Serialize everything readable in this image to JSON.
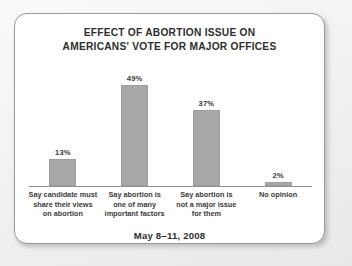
{
  "card": {
    "title_line_1": "EFFECT OF ABORTION ISSUE ON",
    "title_line_2": "AMERICANS' VOTE FOR MAJOR OFFICES",
    "caption": "May 8–11, 2008"
  },
  "chart_data": {
    "type": "bar",
    "title": "EFFECT OF ABORTION ISSUE ON AMERICANS' VOTE FOR MAJOR OFFICES",
    "subtitle": "May 8–11, 2008",
    "xlabel": "",
    "ylabel": "",
    "ylim": [
      0,
      55
    ],
    "grid": false,
    "legend": false,
    "bar_color": "#a8a8a8",
    "categories": [
      "Say candidate must share their views on abortion",
      "Say abortion is one of many important factors",
      "Say abortion is not a major issue for them",
      "No opinion"
    ],
    "category_lines": [
      [
        "Say candidate must",
        "share their views",
        "on abortion"
      ],
      [
        "Say abortion is",
        "one of many",
        "important factors"
      ],
      [
        "Say abortion is",
        "not a major issue",
        "for them"
      ],
      [
        "No opinion"
      ]
    ],
    "values": [
      13,
      49,
      37,
      2
    ],
    "value_labels": [
      "13%",
      "49%",
      "37%",
      "2%"
    ]
  }
}
